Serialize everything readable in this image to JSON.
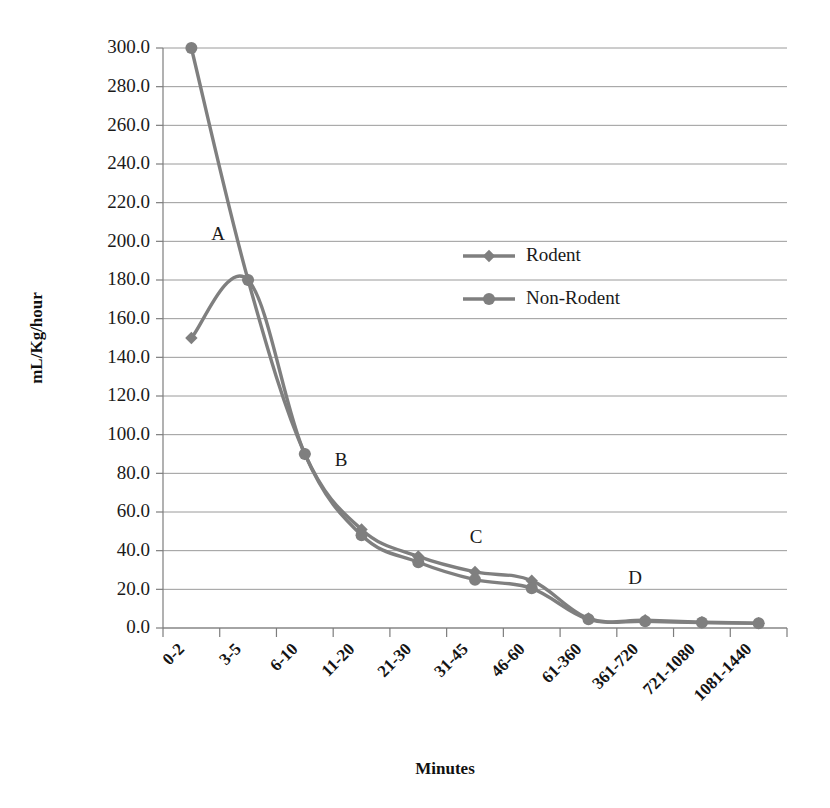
{
  "chart_data": {
    "type": "line",
    "title": "",
    "xlabel": "Minutes",
    "ylabel": "mL/Kg/hour",
    "categories": [
      "0-2",
      "3-5",
      "6-10",
      "11-20",
      "21-30",
      "31-45",
      "46-60",
      "61-360",
      "361-720",
      "721-1080",
      "1081-1440"
    ],
    "ylim": [
      0,
      300
    ],
    "ytick_labels": [
      "0.0",
      "20.0",
      "40.0",
      "60.0",
      "80.0",
      "100.0",
      "120.0",
      "140.0",
      "160.0",
      "180.0",
      "200.0",
      "220.0",
      "240.0",
      "260.0",
      "280.0",
      "300.0"
    ],
    "ytick_values": [
      0,
      20,
      40,
      60,
      80,
      100,
      120,
      140,
      160,
      180,
      200,
      220,
      240,
      260,
      280,
      300
    ],
    "grid": true,
    "legend_position": "upper-center",
    "series": [
      {
        "name": "Rodent",
        "marker": "diamond",
        "color": "#7f7f7f",
        "values": [
          150.0,
          180.0,
          90.0,
          51.0,
          37.0,
          29.0,
          24.5,
          5.0,
          4.0,
          3.0,
          2.5
        ]
      },
      {
        "name": "Non-Rodent",
        "marker": "circle",
        "color": "#7f7f7f",
        "values": [
          300.0,
          180.0,
          90.0,
          48.0,
          34.0,
          25.0,
          20.5,
          4.5,
          3.5,
          2.8,
          2.4
        ]
      }
    ],
    "annotations": [
      {
        "label": "A",
        "x_px": 218,
        "y_px": 240
      },
      {
        "label": "B",
        "x_px": 341,
        "y_px": 466
      },
      {
        "label": "C",
        "x_px": 476,
        "y_px": 543
      },
      {
        "label": "D",
        "x_px": 635,
        "y_px": 584
      }
    ]
  },
  "legend": {
    "entries": [
      {
        "label": "Rodent",
        "marker": "diamond"
      },
      {
        "label": "Non-Rodent",
        "marker": "circle"
      }
    ]
  },
  "colors": {
    "series": "#7f7f7f",
    "grid": "#9a9a9a",
    "axis": "#7d7d7d",
    "text": "#1a1a1a"
  }
}
